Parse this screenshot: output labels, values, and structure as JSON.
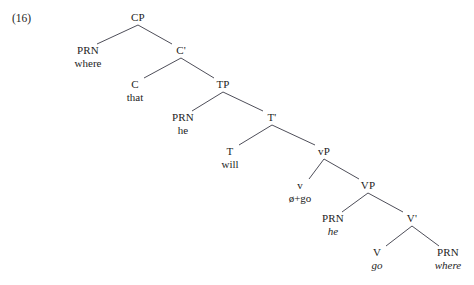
{
  "figure": {
    "number_label": "(16)",
    "number_x": 12,
    "number_y": 12,
    "width": 474,
    "height": 285,
    "line_color": "#3a3a46",
    "text_color": "#1d1d1d",
    "background": "#ffffff"
  },
  "tree": {
    "nodes": [
      {
        "id": "CP",
        "category": "CP",
        "terminal": "",
        "italic": false,
        "x": 138,
        "y": 12
      },
      {
        "id": "PRN1",
        "category": "PRN",
        "terminal": "where",
        "italic": false,
        "x": 88,
        "y": 45
      },
      {
        "id": "Cbar",
        "category": "C'",
        "terminal": "",
        "italic": false,
        "x": 181,
        "y": 45
      },
      {
        "id": "C",
        "category": "C",
        "terminal": "that",
        "italic": false,
        "x": 135,
        "y": 79
      },
      {
        "id": "TP",
        "category": "TP",
        "terminal": "",
        "italic": false,
        "x": 223,
        "y": 79
      },
      {
        "id": "PRN2",
        "category": "PRN",
        "terminal": "he",
        "italic": false,
        "x": 183,
        "y": 112
      },
      {
        "id": "Tbar",
        "category": "T'",
        "terminal": "",
        "italic": false,
        "x": 272,
        "y": 112
      },
      {
        "id": "T",
        "category": "T",
        "terminal": "will",
        "italic": false,
        "x": 230,
        "y": 146
      },
      {
        "id": "vP",
        "category": "vP",
        "terminal": "",
        "italic": false,
        "x": 324,
        "y": 146
      },
      {
        "id": "v",
        "category": "v",
        "terminal": "ø+go",
        "italic": false,
        "x": 300,
        "y": 180
      },
      {
        "id": "VP",
        "category": "VP",
        "terminal": "",
        "italic": false,
        "x": 368,
        "y": 180
      },
      {
        "id": "PRN3",
        "category": "PRN",
        "terminal": "he",
        "italic": true,
        "x": 333,
        "y": 213
      },
      {
        "id": "Vbar",
        "category": "V'",
        "terminal": "",
        "italic": false,
        "x": 412,
        "y": 213
      },
      {
        "id": "V",
        "category": "V",
        "terminal": "go",
        "italic": true,
        "x": 377,
        "y": 247
      },
      {
        "id": "PRN4",
        "category": "PRN",
        "terminal": "where",
        "italic": true,
        "x": 448,
        "y": 247
      }
    ],
    "edges": [
      {
        "from": "CP",
        "to": "PRN1"
      },
      {
        "from": "CP",
        "to": "Cbar"
      },
      {
        "from": "Cbar",
        "to": "C"
      },
      {
        "from": "Cbar",
        "to": "TP"
      },
      {
        "from": "TP",
        "to": "PRN2"
      },
      {
        "from": "TP",
        "to": "Tbar"
      },
      {
        "from": "Tbar",
        "to": "T"
      },
      {
        "from": "Tbar",
        "to": "vP"
      },
      {
        "from": "vP",
        "to": "v"
      },
      {
        "from": "vP",
        "to": "VP"
      },
      {
        "from": "VP",
        "to": "PRN3"
      },
      {
        "from": "VP",
        "to": "Vbar"
      },
      {
        "from": "Vbar",
        "to": "V"
      },
      {
        "from": "Vbar",
        "to": "PRN4"
      }
    ]
  }
}
